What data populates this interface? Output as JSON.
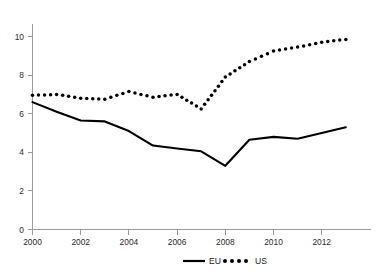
{
  "chart_data": {
    "type": "line",
    "title": "",
    "subtitle": "",
    "xlabel": "",
    "ylabel": "",
    "xlim": [
      2000,
      2013
    ],
    "ylim": [
      0,
      11
    ],
    "grid": false,
    "legend_position": "bottom-center",
    "x": [
      2000,
      2001,
      2002,
      2003,
      2004,
      2005,
      2006,
      2007,
      2008,
      2009,
      2010,
      2011,
      2012,
      2013
    ],
    "xtick_labels": [
      "2000",
      "2002",
      "2004",
      "2006",
      "2008",
      "2010",
      "2012"
    ],
    "xtick_values": [
      2000,
      2002,
      2004,
      2006,
      2008,
      2010,
      2012
    ],
    "ytick_labels": [
      "0",
      "2",
      "4",
      "6",
      "8",
      "10"
    ],
    "ytick_values": [
      0,
      2,
      4,
      6,
      8,
      10
    ],
    "series": [
      {
        "name": "EU",
        "style": "solid-line",
        "color": "#000000",
        "values": [
          6.6,
          6.1,
          5.65,
          5.6,
          5.1,
          4.35,
          4.2,
          4.05,
          3.3,
          4.65,
          4.8,
          4.7,
          5.0,
          5.3
        ]
      },
      {
        "name": "US",
        "style": "dotted",
        "color": "#000000",
        "values": [
          6.95,
          7.0,
          6.8,
          6.75,
          7.15,
          6.85,
          7.0,
          6.25,
          7.9,
          8.7,
          9.25,
          9.45,
          9.7,
          9.85
        ]
      }
    ]
  },
  "legend": {
    "items": [
      {
        "label": "EU",
        "marker": "solid-line"
      },
      {
        "label": "US",
        "marker": "dotted-line"
      }
    ]
  },
  "axes": {
    "y_axis_name": "value-axis",
    "x_axis_name": "year-axis"
  }
}
